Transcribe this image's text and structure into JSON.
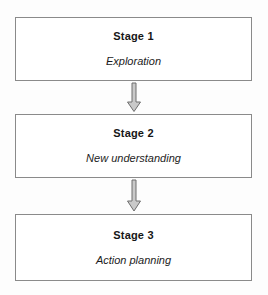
{
  "diagram": {
    "background_color": "#fdfdfd",
    "box_border_color": "#8a8a8a",
    "box_fill_color": "#ffffff",
    "arrow_fill_color": "#c9c9c9",
    "arrow_stroke_color": "#6e6e6e",
    "text_color": "#161616",
    "stages": [
      {
        "title": "Stage 1",
        "caption": "Exploration"
      },
      {
        "title": "Stage 2",
        "caption": "New understanding"
      },
      {
        "title": "Stage 3",
        "caption": "Action planning"
      }
    ],
    "connectors": [
      {
        "icon": "down-arrow-icon",
        "from": "Stage 1",
        "to": "Stage 2"
      },
      {
        "icon": "down-arrow-icon",
        "from": "Stage 2",
        "to": "Stage 3"
      }
    ]
  }
}
